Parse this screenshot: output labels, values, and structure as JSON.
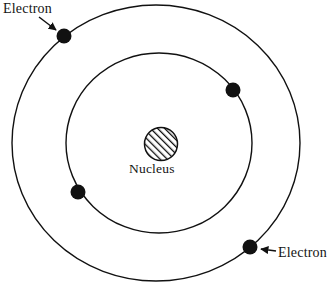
{
  "figure": {
    "background_color": "#ffffff",
    "stroke_color": "#111111",
    "width": 334,
    "height": 287
  },
  "labels": {
    "electron_top_left": "Electron",
    "electron_bottom_right": "Electron",
    "nucleus": "Nucleus"
  },
  "diagram_data": {
    "type": "diagram",
    "nucleus": {
      "name": "Nucleus",
      "center": [
        161,
        144
      ],
      "radius": 16.5,
      "fill": "hatched",
      "hatch_angle_deg": 45,
      "hatch_color": "#111111"
    },
    "orbits": [
      {
        "name": "outer-orbit",
        "center": [
          156,
          143
        ],
        "rx": 144,
        "ry": 138,
        "stroke": "#111111",
        "stroke_width": 1.4
      },
      {
        "name": "inner-orbit",
        "center": [
          159,
          143
        ],
        "rx": 93,
        "ry": 90,
        "stroke": "#111111",
        "stroke_width": 1.4
      }
    ],
    "electrons": [
      {
        "name": "electron-outer-top-left",
        "orbit": "outer-orbit",
        "center": [
          64,
          36
        ],
        "radius": 7.5,
        "fill": "#111111"
      },
      {
        "name": "electron-inner-top-right",
        "orbit": "inner-orbit",
        "center": [
          233,
          90
        ],
        "radius": 7.5,
        "fill": "#111111"
      },
      {
        "name": "electron-inner-bottom-left",
        "orbit": "inner-orbit",
        "center": [
          78,
          192
        ],
        "radius": 7.5,
        "fill": "#111111"
      },
      {
        "name": "electron-outer-bottom-right",
        "orbit": "outer-orbit",
        "center": [
          250,
          247
        ],
        "radius": 7.5,
        "fill": "#111111"
      }
    ],
    "leader_arrows": [
      {
        "name": "arrow-electron-top-left",
        "from": [
          40,
          18
        ],
        "to": [
          58,
          31
        ],
        "direction": "down-right"
      },
      {
        "name": "arrow-electron-bottom-right",
        "from": [
          275,
          252
        ],
        "to": [
          259,
          250
        ],
        "direction": "left"
      }
    ]
  }
}
